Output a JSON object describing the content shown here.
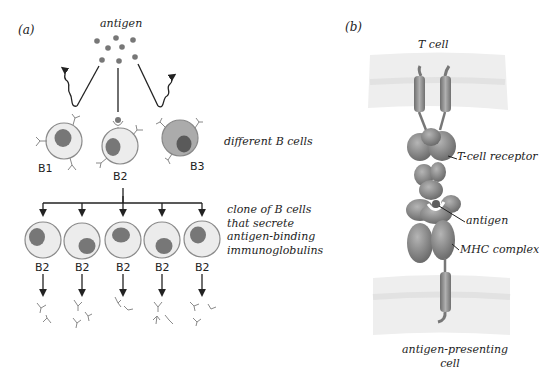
{
  "panel_a": {
    "label": "(a)",
    "antigen_label": "antigen",
    "initial_cells": [
      "B1",
      "B2",
      "B3"
    ],
    "initial_caption": "different B cells",
    "clone_cells": [
      "B2",
      "B2",
      "B2",
      "B2",
      "B2"
    ],
    "clone_caption": [
      "clone of B cells",
      "that secrete",
      "antigen-binding",
      "immunoglobulins"
    ]
  },
  "panel_b": {
    "label": "(b)",
    "top_label": "T cell",
    "receptor_label": "T-cell receptor",
    "antigen_label": "antigen",
    "mhc_label": "MHC complex",
    "bottom_label": [
      "antigen-presenting",
      "cell"
    ]
  },
  "colors": {
    "cell_fill": "#e8e8e8",
    "cell_stroke": "#8a8a8a",
    "nucleus": "#7a7a7a",
    "b3_fill": "#a9a9a9",
    "nucleus_b3": "#5a5a5a",
    "protein": "#7f7f7f",
    "membrane": "#ececec",
    "line": "#222222"
  }
}
